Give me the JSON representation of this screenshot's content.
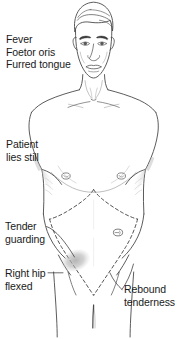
{
  "figure": {
    "background_color": "#ffffff",
    "line_color": "#4a4a4a",
    "text_color": "#1a1a1a",
    "shade_color": "#b8b8b8"
  },
  "annotations": [
    {
      "id": "fever",
      "name": "annotation-fever",
      "lines": [
        "Fever",
        "Foetor oris",
        "Furred tongue"
      ],
      "side": "left",
      "has_leader_line": false
    },
    {
      "id": "patient-lies-still",
      "name": "annotation-patient-lies-still",
      "lines": [
        "Patient",
        "lies still"
      ],
      "side": "left",
      "has_leader_line": false
    },
    {
      "id": "tender-guarding",
      "name": "annotation-tender-guarding",
      "lines": [
        "Tender",
        "guarding"
      ],
      "side": "left",
      "has_leader_line": true
    },
    {
      "id": "right-hip-flexed",
      "name": "annotation-right-hip-flexed",
      "lines": [
        "Right hip",
        "flexed"
      ],
      "side": "left",
      "has_leader_line": true
    },
    {
      "id": "rebound-tenderness",
      "name": "annotation-rebound-tenderness",
      "lines": [
        "Rebound",
        "tenderness"
      ],
      "side": "right",
      "has_leader_line": true
    }
  ],
  "anatomy_markers": [
    {
      "id": "nipple-left",
      "name": "nipple-marker-left",
      "label": ""
    },
    {
      "id": "nipple-right",
      "name": "nipple-marker-right",
      "label": ""
    },
    {
      "id": "umbilicus",
      "name": "umbilicus-marker",
      "label": ""
    },
    {
      "id": "tender-spot",
      "name": "tender-area-shading",
      "label": ""
    },
    {
      "id": "costal-margin",
      "name": "costal-margin-dashed-line",
      "label": ""
    }
  ]
}
